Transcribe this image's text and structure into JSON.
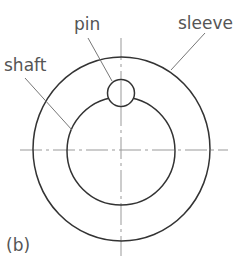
{
  "diagram": {
    "labels": {
      "pin": "pin",
      "sleeve": "sleeve",
      "shaft": "shaft",
      "panel": "(b)"
    },
    "colors": {
      "stroke": "#333333",
      "leader": "#777777",
      "centerline": "#999999",
      "text": "#555555"
    }
  }
}
